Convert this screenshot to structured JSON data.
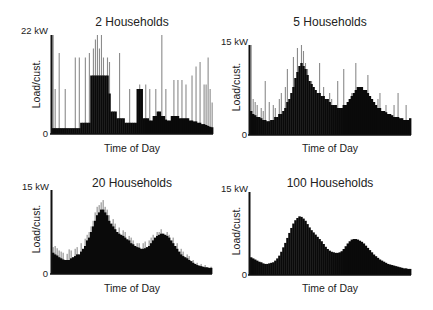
{
  "figure": {
    "ylabel": "Load/cust.",
    "xlabel": "Time of Day",
    "zero_label": "0"
  },
  "colors": {
    "bars": "#0a0a0a",
    "spikes": "#8c8c8c",
    "axis": "#111111"
  },
  "panels": [
    {
      "title": "2 Households",
      "ymax_label": "22 kW",
      "ymax": 22,
      "box": {
        "x": 52,
        "y": 35,
        "w": 161,
        "h": 99
      },
      "title_pos": {
        "x": 132,
        "y": 15
      },
      "ymax_pos": {
        "x": 48,
        "y": 31
      },
      "ylabel_pos": {
        "x": 36,
        "y": 85
      },
      "xlabel_pos": {
        "x": 132,
        "y": 142
      },
      "zero_pos": {
        "x": 48,
        "y": 128
      }
    },
    {
      "title": "5 Households",
      "ymax_label": "15 kW",
      "ymax": 15,
      "box": {
        "x": 250,
        "y": 45,
        "w": 161,
        "h": 90
      },
      "title_pos": {
        "x": 330,
        "y": 15
      },
      "ymax_pos": {
        "x": 248,
        "y": 42
      },
      "ylabel_pos": {
        "x": 236,
        "y": 88
      },
      "xlabel_pos": {
        "x": 330,
        "y": 142
      },
      "zero_pos": {
        "x": 247,
        "y": 129
      }
    },
    {
      "title": "20 Households",
      "ymax_label": "15 kW",
      "ymax": 15,
      "box": {
        "x": 52,
        "y": 190,
        "w": 160,
        "h": 84
      },
      "title_pos": {
        "x": 132,
        "y": 176
      },
      "ymax_pos": {
        "x": 49,
        "y": 187
      },
      "ylabel_pos": {
        "x": 36,
        "y": 230
      },
      "xlabel_pos": {
        "x": 132,
        "y": 282
      },
      "zero_pos": {
        "x": 48,
        "y": 268
      }
    },
    {
      "title": "100 Households",
      "ymax_label": "15 kW",
      "ymax": 15,
      "box": {
        "x": 250,
        "y": 192,
        "w": 161,
        "h": 83
      },
      "title_pos": {
        "x": 330,
        "y": 176
      },
      "ymax_pos": {
        "x": 248,
        "y": 189
      },
      "ylabel_pos": {
        "x": 236,
        "y": 232
      },
      "xlabel_pos": {
        "x": 330,
        "y": 282
      },
      "zero_pos": {
        "x": 247,
        "y": 269
      }
    }
  ],
  "chart_data": [
    {
      "type": "bar",
      "title": "2 Households",
      "xlabel": "Time of Day",
      "ylabel": "Load/cust.",
      "ylim": [
        0,
        22
      ],
      "ytick_labels": [
        "0",
        "22 kW"
      ],
      "grid": false,
      "series": [
        {
          "name": "base load",
          "values": [
            1.3,
            1.3,
            1.3,
            1.3,
            1.3,
            1.3,
            1.3,
            1.3,
            1.3,
            1.3,
            1.3,
            1.3,
            1.3,
            1.3,
            2.5,
            2.5,
            2.5,
            2.5,
            2.5,
            13,
            13,
            13,
            13,
            13,
            13,
            13,
            13,
            13,
            9,
            5,
            5,
            5,
            3.5,
            3.5,
            3.5,
            3.5,
            2.5,
            2.5,
            2.5,
            2.5,
            2.5,
            2.5,
            10,
            10,
            10,
            3.5,
            3.5,
            3.5,
            3,
            3,
            4,
            4,
            5,
            5,
            4,
            4,
            3.2,
            3,
            3,
            4,
            4,
            4,
            4,
            3.5,
            3.5,
            3.5,
            3.5,
            3.5,
            3,
            3,
            2.8,
            2.8,
            2.5,
            2.5,
            2.2,
            2.2,
            2,
            1.8,
            1.6,
            1.5
          ]
        },
        {
          "name": "peak spikes",
          "values": [
            22,
            10,
            0,
            18,
            0,
            0,
            10,
            0,
            0,
            0,
            0,
            17,
            0,
            17,
            0,
            0,
            17,
            0,
            18,
            0,
            19,
            21,
            22,
            19,
            22,
            17,
            0,
            17,
            16,
            0,
            0,
            0,
            0,
            18,
            0,
            0,
            0,
            0,
            10,
            0,
            0,
            0,
            0,
            11,
            0,
            0,
            11,
            0,
            10,
            0,
            0,
            10,
            0,
            0,
            22,
            0,
            10,
            0,
            0,
            0,
            12,
            0,
            12,
            0,
            12,
            0,
            11,
            0,
            0,
            13,
            0,
            15,
            0,
            16,
            0,
            11,
            11,
            17,
            10,
            7
          ]
        }
      ]
    },
    {
      "type": "bar",
      "title": "5 Households",
      "xlabel": "Time of Day",
      "ylabel": "Load/cust.",
      "ylim": [
        0,
        15
      ],
      "ytick_labels": [
        "0",
        "15 kW"
      ],
      "grid": false,
      "series": [
        {
          "name": "base load",
          "values": [
            4,
            3.5,
            3.3,
            3,
            3,
            2.8,
            2.5,
            2.5,
            2.3,
            2.3,
            2.5,
            2.5,
            3,
            3,
            3.5,
            3.5,
            4,
            4.5,
            5.5,
            6,
            7,
            8,
            9.5,
            10.5,
            11.5,
            12,
            11.5,
            11,
            10,
            9,
            8.5,
            8,
            7.5,
            7,
            7,
            6.5,
            6.5,
            6,
            6,
            5.5,
            5,
            5,
            5,
            4.5,
            4.5,
            4.5,
            5,
            5,
            5.5,
            6,
            6.5,
            7,
            7.5,
            8,
            8,
            8,
            7.5,
            7.5,
            7,
            6.5,
            6,
            5.5,
            5,
            4.5,
            4.5,
            4,
            4,
            3.8,
            3.5,
            3.5,
            3.3,
            3,
            3,
            3,
            2.8,
            2.8,
            2.5,
            2.5,
            2.5,
            2.8
          ]
        },
        {
          "name": "peak spikes",
          "values": [
            15,
            6,
            5.5,
            5,
            0,
            4.5,
            4,
            9,
            0,
            5.5,
            0,
            5,
            4.5,
            0,
            6,
            7,
            0,
            8,
            11,
            0,
            0,
            13,
            0,
            14.5,
            0,
            15,
            14,
            12,
            11,
            0,
            9,
            0,
            0,
            0,
            12,
            0,
            8,
            0,
            0,
            7,
            6,
            0,
            0,
            9,
            0,
            0,
            11,
            0,
            0,
            0,
            7,
            0,
            12,
            0,
            0,
            0,
            0,
            0,
            10,
            0,
            0,
            0,
            0,
            6,
            7,
            0,
            0,
            5,
            0,
            0,
            0,
            5,
            0,
            7,
            0,
            0,
            0,
            5,
            0,
            0
          ]
        }
      ]
    },
    {
      "type": "bar",
      "title": "20 Households",
      "xlabel": "Time of Day",
      "ylabel": "Load/cust.",
      "ylim": [
        0,
        15
      ],
      "ytick_labels": [
        "0",
        "15 kW"
      ],
      "grid": false,
      "series": [
        {
          "name": "base load",
          "values": [
            3.8,
            3.5,
            3.3,
            3,
            2.8,
            2.6,
            2.5,
            2.5,
            2.5,
            2.8,
            3,
            3.2,
            3.5,
            3.5,
            4,
            4.5,
            5,
            6,
            6.5,
            7.5,
            8.5,
            9.5,
            10.5,
            11,
            11.5,
            11.5,
            11,
            10.5,
            9.5,
            9,
            8.5,
            8,
            7.5,
            7.2,
            7,
            6.8,
            6.5,
            6.2,
            6,
            5.5,
            5.3,
            5,
            4.8,
            4.7,
            4.5,
            4.5,
            4.6,
            4.8,
            5,
            5.5,
            6,
            6.5,
            6.8,
            7,
            7.2,
            7.2,
            7,
            6.8,
            6.5,
            6,
            5.5,
            5,
            4.5,
            4,
            3.5,
            3.2,
            3,
            2.8,
            2.5,
            2.3,
            2,
            1.8,
            1.6,
            1.5,
            1.4,
            1.3,
            1.2,
            1.2,
            1.1,
            1.1
          ]
        },
        {
          "name": "peak spikes",
          "values": [
            4.8,
            5,
            4.6,
            4.2,
            4,
            3.8,
            0,
            3.6,
            4.4,
            4.2,
            0,
            4.5,
            4.8,
            0,
            5.5,
            0,
            6.3,
            7,
            7.5,
            8.5,
            9.5,
            11,
            12,
            12.3,
            12.8,
            13.2,
            12,
            11.5,
            10.5,
            0,
            9.8,
            9,
            0,
            8.3,
            0,
            7.8,
            7.5,
            0,
            6.8,
            6.5,
            6,
            0,
            5.5,
            5.5,
            0,
            5.5,
            5.8,
            0,
            6,
            6.5,
            7,
            0,
            7.5,
            7.5,
            8,
            0,
            0,
            7.5,
            7,
            0,
            6.5,
            0,
            5.5,
            0,
            4.5,
            4,
            0,
            3.5,
            3.2,
            0,
            2.5,
            0,
            2,
            0,
            1.8,
            0,
            1.6,
            0,
            0,
            1.3
          ]
        }
      ]
    },
    {
      "type": "bar",
      "title": "100 Households",
      "xlabel": "Time of Day",
      "ylabel": "Load/cust.",
      "ylim": [
        0,
        15
      ],
      "ytick_labels": [
        "0",
        "15 kW"
      ],
      "grid": false,
      "series": [
        {
          "name": "base load",
          "values": [
            3.2,
            3,
            2.8,
            2.6,
            2.4,
            2.3,
            2.1,
            2,
            2,
            2.1,
            2.2,
            2.3,
            2.6,
            3,
            3.5,
            4.2,
            5,
            5.8,
            6.7,
            7.6,
            8.5,
            9.3,
            9.9,
            10.3,
            10.6,
            10.5,
            10.2,
            9.8,
            9.2,
            8.6,
            8.1,
            7.7,
            7.3,
            6.9,
            6.5,
            6.1,
            5.6,
            5.1,
            4.7,
            4.4,
            4.2,
            4.1,
            4,
            4,
            4.1,
            4.3,
            4.7,
            5.2,
            5.7,
            6.1,
            6.4,
            6.5,
            6.5,
            6.4,
            6.2,
            6,
            5.7,
            5.3,
            4.9,
            4.5,
            4.1,
            3.7,
            3.4,
            3.1,
            2.8,
            2.6,
            2.4,
            2.2,
            2,
            1.9,
            1.8,
            1.7,
            1.6,
            1.5,
            1.4,
            1.3,
            1.2,
            1.2,
            1.1,
            1.1
          ]
        },
        {
          "name": "peak spikes",
          "values": []
        }
      ]
    }
  ]
}
